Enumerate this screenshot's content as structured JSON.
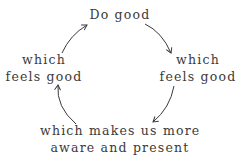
{
  "diagram": {
    "nodes": [
      {
        "id": "top",
        "lines": [
          "Do good"
        ]
      },
      {
        "id": "right",
        "lines": [
          "which",
          "feels good"
        ]
      },
      {
        "id": "bottom",
        "lines": [
          "which makes us more",
          "aware and present"
        ]
      },
      {
        "id": "left",
        "lines": [
          "which",
          "feels good"
        ]
      }
    ],
    "edges": [
      {
        "from": "top",
        "to": "right"
      },
      {
        "from": "right",
        "to": "bottom"
      },
      {
        "from": "bottom",
        "to": "left"
      },
      {
        "from": "left",
        "to": "top"
      }
    ],
    "stroke_color": "#3a3a3a"
  }
}
